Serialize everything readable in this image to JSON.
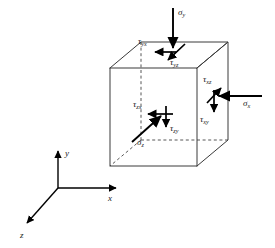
{
  "figure": {
    "background_color": "#ffffff",
    "line_color": "#333333",
    "arrow_color": "#000000",
    "text_color": "#1a1a1a"
  },
  "cube": {
    "name": "stress-cube",
    "front_face": {
      "top_left": [
        110,
        68
      ],
      "top_right": [
        197,
        68
      ],
      "bottom_right": [
        197,
        166
      ],
      "bottom_left": [
        110,
        166
      ]
    },
    "back_offset": [
      31,
      -26
    ],
    "solid_edges": 9,
    "hidden_edges": 3,
    "hidden_edge_style": "dashed"
  },
  "stresses": [
    {
      "id": "sigma-y",
      "symbol": "σ",
      "subscript": "y",
      "face": "top",
      "type": "normal",
      "direction": "down",
      "label_x": 178,
      "label_y": 12
    },
    {
      "id": "tau-yx",
      "symbol": "τ",
      "subscript": "yx",
      "face": "top",
      "type": "shear",
      "direction": "left",
      "label_x": 140,
      "label_y": 40
    },
    {
      "id": "tau-yz",
      "symbol": "τ",
      "subscript": "yz",
      "face": "top",
      "type": "shear",
      "direction": "down-right",
      "label_x": 172,
      "label_y": 62
    },
    {
      "id": "sigma-x",
      "symbol": "σ",
      "subscript": "x",
      "face": "right",
      "type": "normal",
      "direction": "left",
      "label_x": 248,
      "label_y": 103
    },
    {
      "id": "tau-xz",
      "symbol": "τ",
      "subscript": "xz",
      "face": "right",
      "type": "shear",
      "direction": "up-right",
      "label_x": 206,
      "label_y": 80
    },
    {
      "id": "tau-xy",
      "symbol": "τ",
      "subscript": "xy",
      "face": "right",
      "type": "shear",
      "direction": "down",
      "label_x": 205,
      "label_y": 118
    },
    {
      "id": "sigma-z",
      "symbol": "σ",
      "subscript": "z",
      "face": "front",
      "type": "normal",
      "direction": "up-right",
      "label_x": 139,
      "label_y": 141
    },
    {
      "id": "tau-zx",
      "symbol": "τ",
      "subscript": "zx",
      "face": "front",
      "type": "shear",
      "direction": "left",
      "label_x": 136,
      "label_y": 104
    },
    {
      "id": "tau-zy",
      "symbol": "τ",
      "subscript": "zy",
      "face": "front",
      "type": "shear",
      "direction": "down",
      "label_x": 167,
      "label_y": 128
    }
  ],
  "axes": {
    "name": "coordinate-triad",
    "origin": [
      58,
      188
    ],
    "items": [
      {
        "id": "axis-y",
        "label": "y",
        "direction": "up",
        "tip": [
          58,
          152
        ],
        "label_x": 66,
        "label_y": 152
      },
      {
        "id": "axis-x",
        "label": "x",
        "direction": "right",
        "tip": [
          114,
          188
        ],
        "label_x": 110,
        "label_y": 200
      },
      {
        "id": "axis-z",
        "label": "z",
        "direction": "down-left",
        "tip": [
          28,
          222
        ],
        "label_x": 22,
        "label_y": 236
      }
    ]
  }
}
